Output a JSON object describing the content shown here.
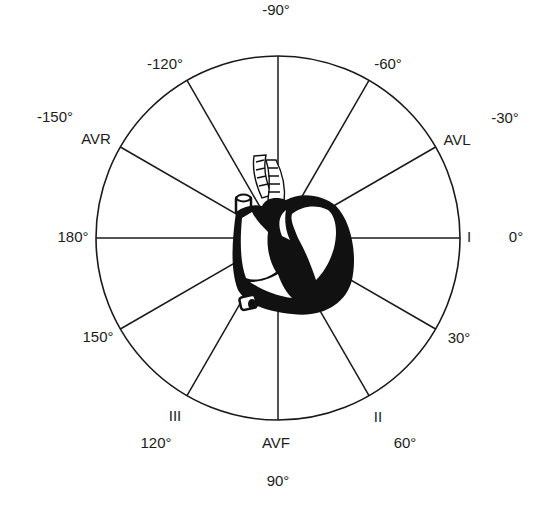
{
  "diagram": {
    "center": {
      "x": 278,
      "y": 238
    },
    "radius": 182,
    "spoke_angles_deg": [
      0,
      30,
      60,
      90,
      120,
      150,
      180,
      -150,
      -120,
      -90,
      -60,
      -30
    ],
    "colors": {
      "line": "#1a1a1a",
      "background": "#ffffff",
      "heart": "#111111"
    },
    "heart_icon": "heart-anatomical-icon",
    "degree_labels": [
      {
        "id": "deg-m90",
        "text": "-90°",
        "x": 276,
        "y": 10
      },
      {
        "id": "deg-m60",
        "text": "-60°",
        "x": 388,
        "y": 64
      },
      {
        "id": "deg-m30",
        "text": "-30°",
        "x": 505,
        "y": 118
      },
      {
        "id": "deg-0",
        "text": "0°",
        "x": 516,
        "y": 237
      },
      {
        "id": "deg-30",
        "text": "30°",
        "x": 459,
        "y": 338
      },
      {
        "id": "deg-60",
        "text": "60°",
        "x": 405,
        "y": 443
      },
      {
        "id": "deg-90",
        "text": "90°",
        "x": 278,
        "y": 481
      },
      {
        "id": "deg-120",
        "text": "120°",
        "x": 156,
        "y": 443
      },
      {
        "id": "deg-150",
        "text": "150°",
        "x": 98,
        "y": 337
      },
      {
        "id": "deg-180",
        "text": "180°",
        "x": 73,
        "y": 237
      },
      {
        "id": "deg-m150",
        "text": "-150°",
        "x": 55,
        "y": 117
      },
      {
        "id": "deg-m120",
        "text": "-120°",
        "x": 165,
        "y": 64
      }
    ],
    "lead_labels": [
      {
        "id": "lead-avr",
        "text": "AVR",
        "x": 96,
        "y": 139
      },
      {
        "id": "lead-avl",
        "text": "AVL",
        "x": 457,
        "y": 140
      },
      {
        "id": "lead-i",
        "text": "I",
        "x": 469,
        "y": 237
      },
      {
        "id": "lead-ii",
        "text": "II",
        "x": 378,
        "y": 417
      },
      {
        "id": "lead-iii",
        "text": "III",
        "x": 175,
        "y": 416
      },
      {
        "id": "lead-avf",
        "text": "AVF",
        "x": 276,
        "y": 443
      }
    ]
  }
}
